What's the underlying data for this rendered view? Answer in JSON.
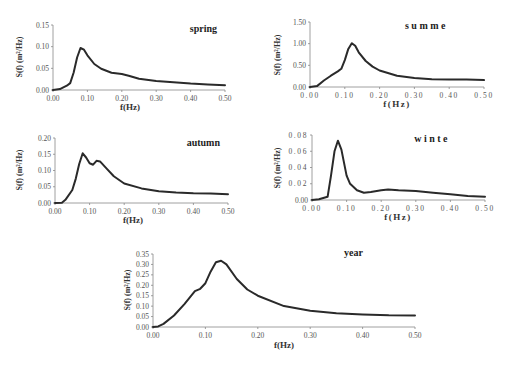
{
  "chart_data": [
    {
      "type": "line",
      "title": "spring",
      "xlabel": "f(Hz)",
      "ylabel": "S(f) (m²/Hz)",
      "xlim": [
        0,
        0.5
      ],
      "ylim": [
        0,
        0.15
      ],
      "xticks": [
        "0.00",
        "0.10",
        "0.20",
        "0.30",
        "0.40",
        "0.50"
      ],
      "yticks": [
        "0.00",
        "0.05",
        "0.10",
        "0.15"
      ],
      "grid": false,
      "x": [
        0.0,
        0.02,
        0.04,
        0.05,
        0.06,
        0.07,
        0.08,
        0.09,
        0.1,
        0.12,
        0.14,
        0.17,
        0.2,
        0.22,
        0.25,
        0.3,
        0.35,
        0.4,
        0.45,
        0.5
      ],
      "values": [
        0.0,
        0.002,
        0.01,
        0.016,
        0.04,
        0.075,
        0.097,
        0.093,
        0.08,
        0.06,
        0.049,
        0.04,
        0.037,
        0.033,
        0.026,
        0.021,
        0.018,
        0.015,
        0.013,
        0.011
      ]
    },
    {
      "type": "line",
      "title": "summe",
      "xlabel": "f(Hz)",
      "ylabel": "S(f) (m²/Hz)",
      "xlim": [
        0,
        0.5
      ],
      "ylim": [
        0,
        1.5
      ],
      "xticks": [
        "0.00",
        "0.10",
        "0.20",
        "0.30",
        "0.40",
        "0.50"
      ],
      "yticks": [
        "0.00",
        "0.50",
        "1.00",
        "1.50"
      ],
      "grid": false,
      "x": [
        0.0,
        0.02,
        0.04,
        0.06,
        0.08,
        0.09,
        0.1,
        0.11,
        0.12,
        0.13,
        0.14,
        0.16,
        0.18,
        0.2,
        0.25,
        0.3,
        0.35,
        0.4,
        0.45,
        0.5
      ],
      "values": [
        0.0,
        0.02,
        0.15,
        0.26,
        0.36,
        0.42,
        0.62,
        0.88,
        1.01,
        0.95,
        0.8,
        0.6,
        0.47,
        0.38,
        0.26,
        0.21,
        0.18,
        0.17,
        0.17,
        0.16
      ]
    },
    {
      "type": "line",
      "title": "autumn",
      "xlabel": "f(Hz)",
      "ylabel": "S(f) (m²/Hz)",
      "xlim": [
        0,
        0.5
      ],
      "ylim": [
        0,
        0.2
      ],
      "xticks": [
        "0.00",
        "0.10",
        "0.20",
        "0.30",
        "0.40",
        "0.50"
      ],
      "yticks": [
        "0.00",
        "0.05",
        "0.10",
        "0.15",
        "0.20"
      ],
      "grid": false,
      "x": [
        0.0,
        0.02,
        0.03,
        0.05,
        0.06,
        0.07,
        0.08,
        0.09,
        0.1,
        0.11,
        0.12,
        0.13,
        0.15,
        0.17,
        0.2,
        0.25,
        0.3,
        0.35,
        0.4,
        0.45,
        0.5
      ],
      "values": [
        0.0,
        0.001,
        0.01,
        0.04,
        0.075,
        0.12,
        0.153,
        0.14,
        0.122,
        0.118,
        0.13,
        0.128,
        0.105,
        0.082,
        0.06,
        0.045,
        0.036,
        0.032,
        0.03,
        0.029,
        0.027
      ]
    },
    {
      "type": "line",
      "title": "winte",
      "xlabel": "f(Hz)",
      "ylabel": "S(f) (m²/Hz)",
      "xlim": [
        0,
        0.5
      ],
      "ylim": [
        0,
        0.08
      ],
      "xticks": [
        "0.00",
        "0.10",
        "0.20",
        "0.30",
        "0.40",
        "0.50"
      ],
      "yticks": [
        "0.00",
        "0.02",
        "0.04",
        "0.06",
        "0.08"
      ],
      "grid": false,
      "x": [
        0.0,
        0.02,
        0.045,
        0.055,
        0.065,
        0.075,
        0.085,
        0.1,
        0.11,
        0.13,
        0.15,
        0.17,
        0.2,
        0.22,
        0.25,
        0.3,
        0.35,
        0.4,
        0.45,
        0.5
      ],
      "values": [
        0.0,
        0.001,
        0.004,
        0.03,
        0.06,
        0.073,
        0.062,
        0.03,
        0.02,
        0.012,
        0.009,
        0.01,
        0.012,
        0.013,
        0.012,
        0.011,
        0.009,
        0.007,
        0.005,
        0.004
      ]
    },
    {
      "type": "line",
      "title": "year",
      "xlabel": "f(Hz)",
      "ylabel": "S(f) (m²/Hz)",
      "xlim": [
        0,
        0.5
      ],
      "ylim": [
        0,
        0.35
      ],
      "xticks": [
        "0.00",
        "0.10",
        "0.20",
        "0.30",
        "0.40",
        "0.50"
      ],
      "yticks": [
        "0.00",
        "0.05",
        "0.10",
        "0.15",
        "0.20",
        "0.25",
        "0.30",
        "0.35"
      ],
      "grid": false,
      "x": [
        0.0,
        0.01,
        0.02,
        0.04,
        0.06,
        0.08,
        0.09,
        0.1,
        0.11,
        0.12,
        0.13,
        0.14,
        0.16,
        0.18,
        0.2,
        0.25,
        0.3,
        0.35,
        0.4,
        0.45,
        0.5
      ],
      "values": [
        0.0,
        0.003,
        0.015,
        0.055,
        0.11,
        0.172,
        0.183,
        0.21,
        0.265,
        0.31,
        0.318,
        0.3,
        0.23,
        0.18,
        0.15,
        0.1,
        0.078,
        0.066,
        0.06,
        0.056,
        0.055
      ]
    }
  ]
}
